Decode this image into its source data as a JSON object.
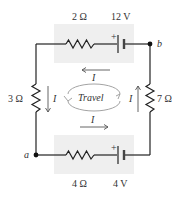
{
  "circuit": {
    "top_branch": {
      "resistor_label": "2 Ω",
      "battery_label": "12 V",
      "battery_polarity": "+"
    },
    "bottom_branch": {
      "resistor_label": "4 Ω",
      "battery_label": "4 V",
      "battery_polarity": "+"
    },
    "left_branch": {
      "resistor_label": "3 Ω",
      "current_label": "I"
    },
    "right_branch": {
      "resistor_label": "7 Ω",
      "current_label": "I"
    },
    "nodes": {
      "a": "a",
      "b": "b"
    },
    "currents": {
      "top": "I",
      "bottom": "I"
    },
    "travel_label": "Travel",
    "colors": {
      "wire": "#222222",
      "box_fill": "#efefef",
      "travel_loop": "#999999",
      "arrow": "#555555"
    }
  }
}
